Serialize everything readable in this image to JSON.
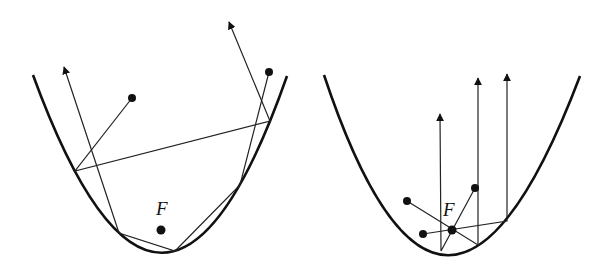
{
  "figure": {
    "panels": [
      {
        "id": "left",
        "description": "Parabolic mirror with source not at focus: rays reflect multiple times",
        "focus_label": "F"
      },
      {
        "id": "right",
        "description": "Parabolic mirror with rays passing through focus reflected parallel to axis",
        "focus_label": "F"
      }
    ],
    "colors": {
      "stroke": "#111111",
      "background": "#ffffff"
    }
  }
}
